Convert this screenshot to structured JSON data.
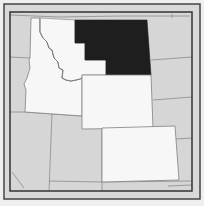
{
  "map": {
    "title": "Northwestern and Mountain West United States",
    "highlighted_region": "Eastern Montana",
    "colors": {
      "background": "#efefef",
      "frame": "#444444",
      "highlight": "#1e1e1e",
      "focus_states": "#f7f7f7",
      "other_states": "#d6d6d6",
      "border_lines": "#808080"
    },
    "regions": [
      {
        "name": "Montana (highlighted east/central)",
        "fill": "highlight"
      },
      {
        "name": "Idaho",
        "fill": "focus_states"
      },
      {
        "name": "Montana (western)",
        "fill": "focus_states"
      },
      {
        "name": "Wyoming",
        "fill": "focus_states"
      },
      {
        "name": "Colorado",
        "fill": "focus_states"
      },
      {
        "name": "Washington",
        "fill": "other_states"
      },
      {
        "name": "Oregon",
        "fill": "other_states"
      },
      {
        "name": "Nevada",
        "fill": "other_states"
      },
      {
        "name": "Utah",
        "fill": "other_states"
      },
      {
        "name": "North Dakota",
        "fill": "other_states"
      },
      {
        "name": "South Dakota",
        "fill": "other_states"
      },
      {
        "name": "Nebraska",
        "fill": "other_states"
      },
      {
        "name": "Kansas",
        "fill": "other_states"
      },
      {
        "name": "Arizona",
        "fill": "other_states"
      },
      {
        "name": "New Mexico",
        "fill": "other_states"
      }
    ]
  }
}
